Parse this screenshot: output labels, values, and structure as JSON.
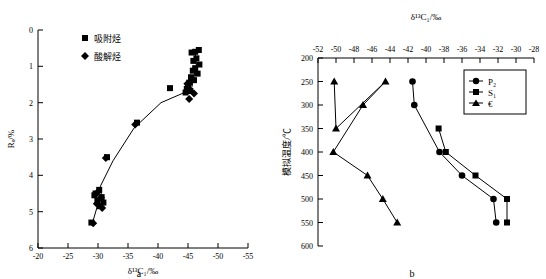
{
  "figure": {
    "panel_a_letter": "a",
    "panel_b_letter": "b"
  },
  "chart_data": [
    {
      "id": "panel_a",
      "type": "scatter",
      "title": "",
      "panel_label": "a",
      "xlabel": "δ¹³C₁/‰",
      "ylabel": "Rₒ/%",
      "xlim": [
        -20,
        -55
      ],
      "ylim": [
        6,
        0
      ],
      "x_ticks": [
        -20,
        -25,
        -30,
        -35,
        -40,
        -45,
        -50,
        -55
      ],
      "x_tick_labels": [
        "-20",
        "-25",
        "-30",
        "-35",
        "-40",
        "-45",
        "-50",
        "-55"
      ],
      "y_ticks": [
        0,
        1,
        2,
        3,
        4,
        5,
        6
      ],
      "y_tick_labels": [
        "0",
        "1",
        "2",
        "3",
        "4",
        "5",
        "6"
      ],
      "grid": false,
      "legend_position": "top-left",
      "series": [
        {
          "name": "吸附烃",
          "marker": "square",
          "points": [
            [
              -46.8,
              0.55
            ],
            [
              -46.2,
              0.6
            ],
            [
              -45.6,
              0.62
            ],
            [
              -46.4,
              0.78
            ],
            [
              -45.9,
              0.85
            ],
            [
              -46.9,
              0.95
            ],
            [
              -46.2,
              1.05
            ],
            [
              -45.8,
              1.12
            ],
            [
              -46.6,
              1.2
            ],
            [
              -45.5,
              1.3
            ],
            [
              -46.0,
              1.38
            ],
            [
              -45.2,
              1.45
            ],
            [
              -45.0,
              1.55
            ],
            [
              -44.8,
              1.62
            ],
            [
              -45.4,
              1.68
            ],
            [
              -44.6,
              1.72
            ],
            [
              -42.0,
              1.6
            ],
            [
              -36.5,
              2.55
            ],
            [
              -31.5,
              3.5
            ],
            [
              -30.2,
              4.4
            ],
            [
              -29.6,
              4.5
            ],
            [
              -30.6,
              4.6
            ],
            [
              -29.9,
              4.7
            ],
            [
              -30.9,
              4.75
            ],
            [
              -30.3,
              4.85
            ],
            [
              -29.4,
              4.55
            ],
            [
              -28.9,
              5.3
            ]
          ]
        },
        {
          "name": "酸解烃",
          "marker": "diamond",
          "points": [
            [
              -45.2,
              1.9
            ],
            [
              -46.0,
              1.75
            ],
            [
              -44.9,
              1.48
            ],
            [
              -36.2,
              2.6
            ],
            [
              -31.3,
              3.52
            ],
            [
              -30.0,
              4.45
            ],
            [
              -30.5,
              4.62
            ],
            [
              -29.8,
              4.78
            ],
            [
              -30.7,
              4.9
            ],
            [
              -29.2,
              5.32
            ]
          ]
        }
      ],
      "trend_curve": [
        [
          -29.0,
          5.35
        ],
        [
          -29.8,
          4.9
        ],
        [
          -30.6,
          4.6
        ],
        [
          -30.4,
          4.3
        ],
        [
          -32.5,
          3.6
        ],
        [
          -36.0,
          2.7
        ],
        [
          -40.5,
          2.0
        ],
        [
          -44.0,
          1.75
        ],
        [
          -45.6,
          1.6
        ],
        [
          -46.4,
          1.0
        ],
        [
          -46.2,
          0.6
        ]
      ]
    },
    {
      "id": "panel_b",
      "type": "line",
      "title": "",
      "panel_label": "b",
      "xlabel": "δ¹³C₁/‰",
      "ylabel": "模拟温度/℃",
      "xlim": [
        -52,
        -28
      ],
      "ylim": [
        600,
        200
      ],
      "x_ticks": [
        -52,
        -50,
        -48,
        -46,
        -44,
        -42,
        -40,
        -38,
        -36,
        -34,
        -32,
        -30,
        -28
      ],
      "x_tick_labels": [
        "-52",
        "-50",
        "-48",
        "-46",
        "-44",
        "-42",
        "-40",
        "-38",
        "-36",
        "-34",
        "-32",
        "-30",
        "-28"
      ],
      "y_ticks": [
        200,
        250,
        300,
        350,
        400,
        450,
        500,
        550,
        600
      ],
      "y_tick_labels": [
        "200",
        "250",
        "300",
        "350",
        "400",
        "450",
        "500",
        "550",
        "600"
      ],
      "grid": false,
      "legend_position": "top-right",
      "series": [
        {
          "name": "P₂",
          "marker": "circle",
          "points": [
            [
              -41.5,
              250
            ],
            [
              -41.3,
              300
            ],
            [
              -38.5,
              400
            ],
            [
              -36.0,
              450
            ],
            [
              -32.5,
              500
            ],
            [
              -32.2,
              550
            ]
          ]
        },
        {
          "name": "S₁",
          "marker": "square",
          "points": [
            [
              -38.6,
              350
            ],
            [
              -37.8,
              400
            ],
            [
              -34.5,
              450
            ],
            [
              -31.0,
              500
            ],
            [
              -31.0,
              550
            ]
          ]
        },
        {
          "name": "€",
          "marker": "triangle",
          "points": [
            [
              -50.2,
              250
            ],
            [
              -50.0,
              350
            ],
            [
              -44.5,
              250
            ],
            [
              -47.0,
              300
            ],
            [
              -50.3,
              400
            ],
            [
              -46.5,
              450
            ],
            [
              -44.8,
              500
            ],
            [
              -43.2,
              550
            ]
          ]
        }
      ]
    }
  ]
}
